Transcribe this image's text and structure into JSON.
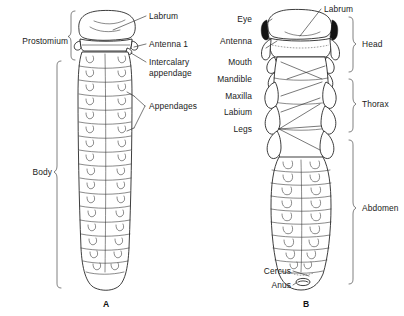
{
  "figure": {
    "background_color": "#ffffff",
    "ink_color": "#1b1b1b",
    "panels": [
      {
        "id": "A",
        "caption": "A",
        "caption_x": 103,
        "caption_y": 299
      },
      {
        "id": "B",
        "caption": "B",
        "caption_x": 303,
        "caption_y": 299
      }
    ]
  },
  "panel_a": {
    "caption": "A",
    "brace_labels": [
      {
        "text": "Prostomium",
        "x": 68,
        "y": 36,
        "align": "right"
      },
      {
        "text": "Body",
        "x": 52,
        "y": 172,
        "align": "right"
      }
    ],
    "leader_labels": [
      {
        "text": "Labrum",
        "x": 148,
        "y": 13,
        "align": "left"
      },
      {
        "text": "Antenna 1",
        "x": 148,
        "y": 41,
        "align": "left"
      },
      {
        "text": "Intercalary",
        "x": 148,
        "y": 62,
        "align": "left"
      },
      {
        "text": "appendage",
        "x": 148,
        "y": 72,
        "align": "left"
      },
      {
        "text": "Appendages",
        "x": 148,
        "y": 103,
        "align": "left"
      }
    ]
  },
  "panel_b": {
    "caption": "B",
    "left_labels": [
      {
        "text": "Eye",
        "x": 253,
        "y": 16
      },
      {
        "text": "Antenna",
        "x": 253,
        "y": 38
      },
      {
        "text": "Mouth",
        "x": 253,
        "y": 59
      },
      {
        "text": "Mandible",
        "x": 253,
        "y": 76
      },
      {
        "text": "Maxilla",
        "x": 253,
        "y": 93
      },
      {
        "text": "Labium",
        "x": 253,
        "y": 109
      },
      {
        "text": "Legs",
        "x": 253,
        "y": 126
      },
      {
        "text": "Cercus",
        "x": 291,
        "y": 268
      },
      {
        "text": "Anus",
        "x": 291,
        "y": 282
      }
    ],
    "top_label": {
      "text": "Labrum",
      "x": 323,
      "y": 6
    },
    "brace_labels": [
      {
        "text": "Head",
        "x": 366,
        "y": 44
      },
      {
        "text": "Thorax",
        "x": 366,
        "y": 104
      },
      {
        "text": "Abdomen",
        "x": 366,
        "y": 208
      }
    ]
  },
  "annotations": {
    "all_label_texts": [
      "Prostomium",
      "Labrum",
      "Antenna 1",
      "Intercalary",
      "appendage",
      "Appendages",
      "Body",
      "A",
      "Eye",
      "Antenna",
      "Mouth",
      "Mandible",
      "Maxilla",
      "Labium",
      "Legs",
      "Cercus",
      "Anus",
      "Labrum",
      "Head",
      "Thorax",
      "Abdomen",
      "B"
    ]
  }
}
